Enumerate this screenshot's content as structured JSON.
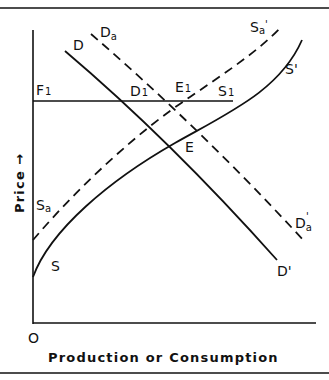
{
  "diagram": {
    "type": "supply-demand",
    "axes": {
      "y_label": "Price",
      "y_arrow": "→",
      "x_label": "Production or Consumption",
      "origin_label": "O"
    },
    "price_line": {
      "label_main": "F",
      "label_sub": "1"
    },
    "curves": {
      "demand": {
        "start": "D",
        "end": "D'",
        "style": "solid"
      },
      "demand_a": {
        "start_main": "D",
        "start_sub": "a",
        "end_main": "D",
        "end_sub": "a",
        "end_prime": "'",
        "style": "dashed"
      },
      "supply": {
        "start": "S",
        "end": "S'",
        "style": "solid"
      },
      "supply_a": {
        "start_main": "S",
        "start_sub": "a",
        "end_main": "S",
        "end_sub": "a",
        "end_prime": "'",
        "style": "dashed"
      }
    },
    "points": {
      "D1": {
        "main": "D",
        "sub": "1"
      },
      "E1": {
        "main": "E",
        "sub": "1"
      },
      "S1": {
        "main": "S",
        "sub": "1"
      },
      "E": {
        "main": "E"
      }
    },
    "colors": {
      "ink": "#111111",
      "background": "#ffffff"
    }
  }
}
